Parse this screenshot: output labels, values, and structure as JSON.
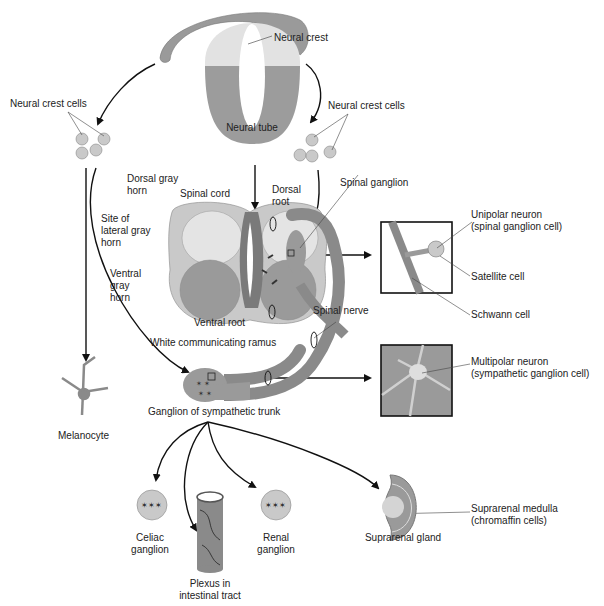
{
  "diagram": {
    "colors": {
      "tissue_gray": "#8f8f8f",
      "tissue_light": "#d4d4d4",
      "tissue_mid": "#b3b3b3",
      "neuron_dark": "#3a3a3a",
      "arrow": "#111111"
    },
    "labels": {
      "neural_crest": "Neural crest",
      "neural_tube": "Neural tube",
      "neural_crest_cells_left": "Neural crest cells",
      "neural_crest_cells_right": "Neural crest cells",
      "dorsal_gray_horn": "Dorsal gray\nhorn",
      "spinal_cord": "Spinal cord",
      "dorsal_root": "Dorsal\nroot",
      "spinal_ganglion": "Spinal ganglion",
      "site_of_lateral_gray_horn": "Site of\nlateral gray\nhorn",
      "ventral_gray_horn": "Ventral\ngray\nhorn",
      "ventral_root": "Ventral root",
      "spinal_nerve": "Spinal nerve",
      "white_communicating_ramus": "White communicating ramus",
      "ganglion_of_sympathetic_trunk": "Ganglion of sympathetic trunk",
      "melanocyte": "Melanocyte",
      "unipolar_neuron": "Unipolar neuron\n(spinal ganglion cell)",
      "satellite_cell": "Satellite cell",
      "schwann_cell": "Schwann cell",
      "multipolar_neuron": "Multipolar neuron\n(sympathetic ganglion cell)",
      "celiac_ganglion": "Celiac\nganglion",
      "plexus_in_intestinal_tract": "Plexus in\nintestinal tract",
      "renal_ganglion": "Renal\nganglion",
      "suprarenal_gland": "Suprarenal gland",
      "suprarenal_medulla": "Suprarenal medulla\n(chromaffin cells)"
    }
  }
}
